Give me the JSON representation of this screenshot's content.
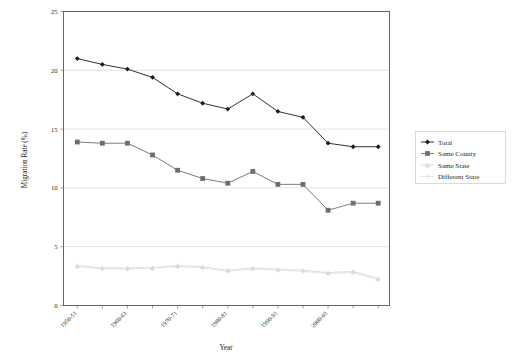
{
  "chart_data": {
    "type": "line",
    "title": "",
    "xlabel": "Year",
    "ylabel": "Migration Rate (%)",
    "ylim": [
      0,
      25
    ],
    "yticks": [
      0,
      5,
      10,
      15,
      20,
      25
    ],
    "ytick_labels": [
      "0",
      "5",
      "10",
      "15",
      "20",
      "25"
    ],
    "grid": true,
    "legend_position": "right",
    "x_tick_labels_rotated": true,
    "categories": [
      "1950-51",
      "1955-56",
      "1960-61",
      "1965-66",
      "1970-71",
      "1975-76",
      "1980-81",
      "1985-86",
      "1990-91",
      "1995-96",
      "2000-01",
      "2003-04",
      "2005-06"
    ],
    "labeled_categories": [
      "1950-51",
      "1960-61",
      "1970-71",
      "1980-81",
      "1990-91",
      "2000-01"
    ],
    "series": [
      {
        "name": "Total",
        "color": "#1a1a1a",
        "marker": "diamond",
        "values": [
          21.0,
          20.5,
          20.1,
          19.4,
          18.0,
          17.2,
          16.7,
          18.0,
          16.5,
          16.0,
          13.8,
          13.5,
          13.5
        ]
      },
      {
        "name": "Same County",
        "color": "#6e6e6e",
        "marker": "square",
        "values": [
          13.9,
          13.8,
          13.8,
          12.8,
          11.5,
          10.8,
          10.4,
          11.4,
          10.3,
          10.3,
          8.1,
          8.7,
          8.7
        ]
      },
      {
        "name": "Same State",
        "color": "#d9d9d9",
        "marker": "triangle",
        "values": [
          3.4,
          3.2,
          3.2,
          3.2,
          3.4,
          3.3,
          3.0,
          3.2,
          3.1,
          3.0,
          2.8,
          2.9,
          2.3
        ]
      },
      {
        "name": "Different State",
        "color": "#e3e3e3",
        "marker": "cross",
        "values": [
          3.3,
          3.1,
          3.1,
          3.2,
          3.3,
          3.2,
          2.9,
          3.1,
          3.0,
          2.9,
          2.7,
          2.8,
          2.2
        ]
      }
    ]
  },
  "legend": {
    "entries": [
      {
        "label": "Total"
      },
      {
        "label": "Same County"
      },
      {
        "label": "Same State"
      },
      {
        "label": "Different State"
      }
    ]
  }
}
